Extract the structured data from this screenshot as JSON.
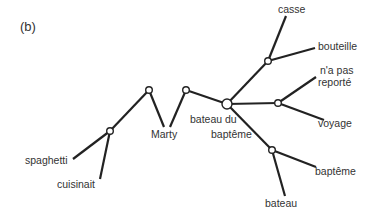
{
  "panel_label": "(b)",
  "colors": {
    "line": "#222222",
    "node_fill": "#ffffff",
    "text": "#333333"
  },
  "nodes": [
    {
      "id": "n_spaghetti_cuisinait",
      "x": 110,
      "y": 131,
      "r": 3.3
    },
    {
      "id": "n_left_peak",
      "x": 149,
      "y": 90,
      "r": 3.3
    },
    {
      "id": "n_right_peak",
      "x": 186,
      "y": 90,
      "r": 3.3
    },
    {
      "id": "n_bateau_du_bapteme",
      "x": 227,
      "y": 104,
      "r": 5
    },
    {
      "id": "n_casse_bouteille",
      "x": 268,
      "y": 61,
      "r": 3.3
    },
    {
      "id": "n_reporte_voyage",
      "x": 278,
      "y": 103,
      "r": 3.3
    },
    {
      "id": "n_bapteme_bateau",
      "x": 272,
      "y": 150,
      "r": 3.3
    }
  ],
  "labels": {
    "spaghetti": "spaghetti",
    "cuisinait": "cuisinait",
    "marty": "Marty",
    "bateau_du_bapteme_line1": "bateau du",
    "bateau_du_bapteme_line2": "baptême",
    "casse": "casse",
    "bouteille": "bouteille",
    "na_pas_reporte_line1": "n'a pas",
    "na_pas_reporte_line2": "reporté",
    "voyage": "voyage",
    "bapteme": "baptême",
    "bateau": "bateau"
  }
}
